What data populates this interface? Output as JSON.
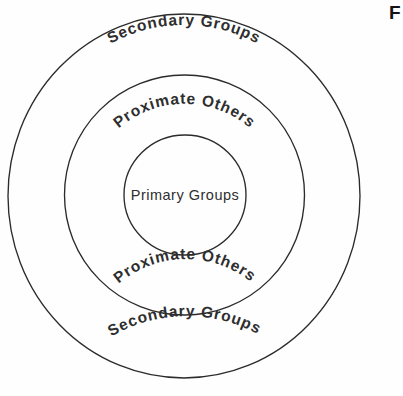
{
  "figure": {
    "marker_label": "F"
  },
  "diagram": {
    "type": "concentric-rings",
    "background_color": "#fefefe",
    "stroke_color": "#2b2b2b",
    "text_color": "#2e2e2e",
    "rings": [
      {
        "id": "outer",
        "label": "Secondary Groups",
        "level": 3,
        "center_x": 184,
        "center_y": 196,
        "radius_x": 176,
        "radius_y": 182
      },
      {
        "id": "middle",
        "label": "Proximate Others",
        "level": 2,
        "center_x": 184.5,
        "center_y": 195,
        "radius_x": 120,
        "radius_y": 120
      },
      {
        "id": "inner",
        "label": "Primary Groups",
        "level": 1,
        "center_x": 185,
        "center_y": 195,
        "radius_x": 61,
        "radius_y": 60
      }
    ],
    "labels": {
      "secondary_top": "Secondary Groups",
      "proximate_top": "Proximate Others",
      "primary_center": "Primary Groups",
      "proximate_bottom": "Proximate Others",
      "secondary_bottom": "Secondary Groups"
    }
  }
}
